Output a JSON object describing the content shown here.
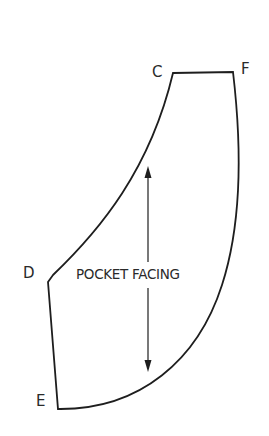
{
  "diagram": {
    "title": "POCKET FACING",
    "points": {
      "C": "C",
      "F": "F",
      "D": "D",
      "E": "E"
    },
    "grainline": "double-headed arrow (grain line)",
    "stroke_color": "#1e1e1e"
  }
}
